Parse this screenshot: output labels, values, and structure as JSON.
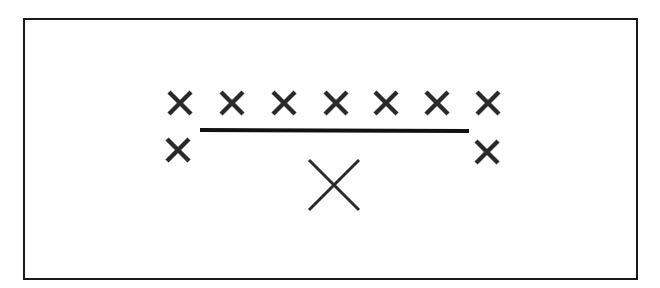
{
  "diagram": {
    "colors": {
      "stroke": "#2a2a2a",
      "frame": "#1a1a1a",
      "background": "#ffffff"
    },
    "small_marks": [
      {
        "id": "top-1",
        "x": 180,
        "y": 103,
        "size": 22
      },
      {
        "id": "top-2",
        "x": 232,
        "y": 103,
        "size": 22
      },
      {
        "id": "top-3",
        "x": 284,
        "y": 103,
        "size": 22
      },
      {
        "id": "top-4",
        "x": 336,
        "y": 103,
        "size": 22
      },
      {
        "id": "top-5",
        "x": 386,
        "y": 103,
        "size": 22
      },
      {
        "id": "top-6",
        "x": 437,
        "y": 103,
        "size": 22
      },
      {
        "id": "top-7",
        "x": 488,
        "y": 103,
        "size": 22
      },
      {
        "id": "left-side",
        "x": 178,
        "y": 150,
        "size": 22
      },
      {
        "id": "right-side",
        "x": 487,
        "y": 152,
        "size": 22
      }
    ],
    "line": {
      "x1": 200,
      "y1": 130,
      "x2": 469,
      "y2": 131,
      "width": 4
    },
    "large_mark": {
      "x": 334,
      "y": 185,
      "size": 50,
      "width": 3
    }
  }
}
